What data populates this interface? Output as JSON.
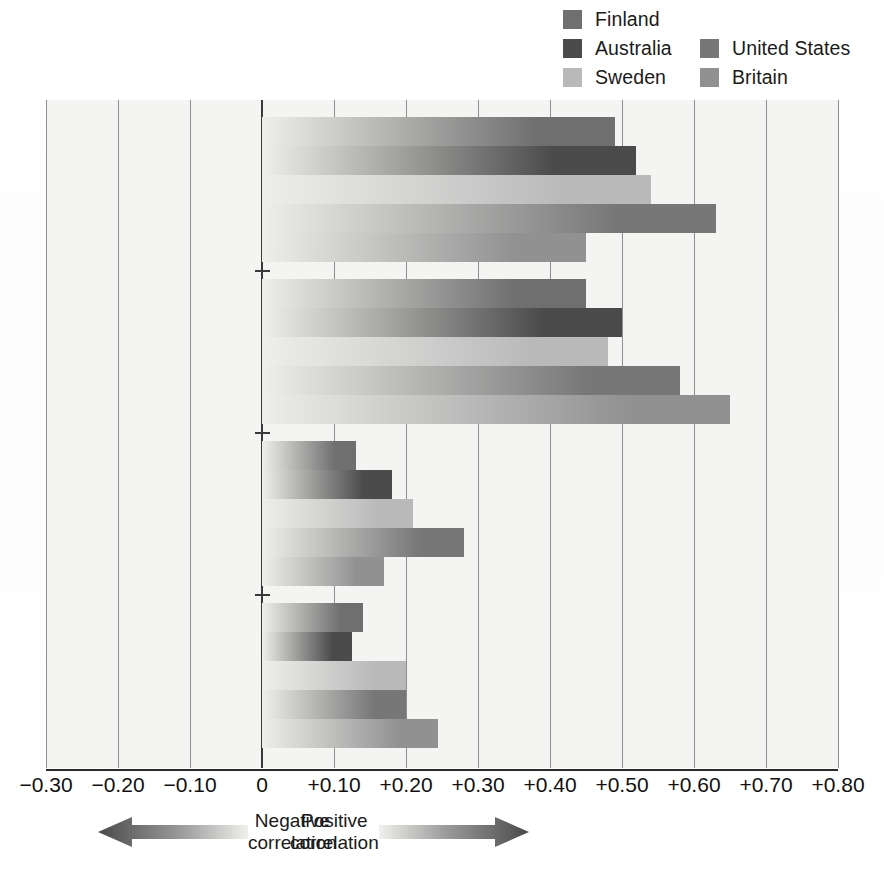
{
  "legend": {
    "items": [
      {
        "label": "Finland",
        "color": "#6f6f6f"
      },
      {
        "label": "Australia",
        "color": "#4b4b4b"
      },
      {
        "label": "Sweden",
        "color": "#b9b9b9"
      },
      {
        "label": "United States",
        "color": "#777777"
      },
      {
        "label": "Britain",
        "color": "#919191"
      }
    ]
  },
  "correlation_legend": {
    "negative": "Negative\ncorrelation",
    "positive": "Positive\ncorrelation",
    "negative_arrow_icon": "left-arrow-gradient-icon",
    "positive_arrow_icon": "right-arrow-gradient-icon"
  },
  "chart_data": {
    "type": "bar",
    "orientation": "horizontal",
    "title": "",
    "xlabel": "",
    "ylabel": "",
    "xlim": [
      -0.3,
      0.8
    ],
    "xticks": [
      -0.3,
      -0.2,
      -0.1,
      0,
      0.1,
      0.2,
      0.3,
      0.4,
      0.5,
      0.6,
      0.7,
      0.8
    ],
    "xticklabels": [
      "−0.30",
      "−0.20",
      "−0.10",
      "0",
      "+0.10",
      "+0.20",
      "+0.30",
      "+0.40",
      "+0.50",
      "+0.60",
      "+0.70",
      "+0.80"
    ],
    "grid": true,
    "legend_position": "top-right",
    "categories": [
      "Monozygotic\nfemale pairs",
      "Monozygotic\nmale pairs",
      "Dizygotic\nfemale pairs",
      "Dizygotic\nmale pairs"
    ],
    "series": [
      {
        "name": "Finland",
        "color": "#6f6f6f",
        "values": [
          0.49,
          0.45,
          0.13,
          0.14
        ]
      },
      {
        "name": "Australia",
        "color": "#4b4b4b",
        "values": [
          0.52,
          0.5,
          0.18,
          0.125
        ]
      },
      {
        "name": "Sweden",
        "color": "#b9b9b9",
        "values": [
          0.54,
          0.48,
          0.21,
          0.2
        ]
      },
      {
        "name": "United States",
        "color": "#777777",
        "values": [
          0.63,
          0.58,
          0.28,
          0.2
        ]
      },
      {
        "name": "Britain",
        "color": "#919191",
        "values": [
          0.45,
          0.65,
          0.17,
          0.245
        ]
      }
    ]
  }
}
